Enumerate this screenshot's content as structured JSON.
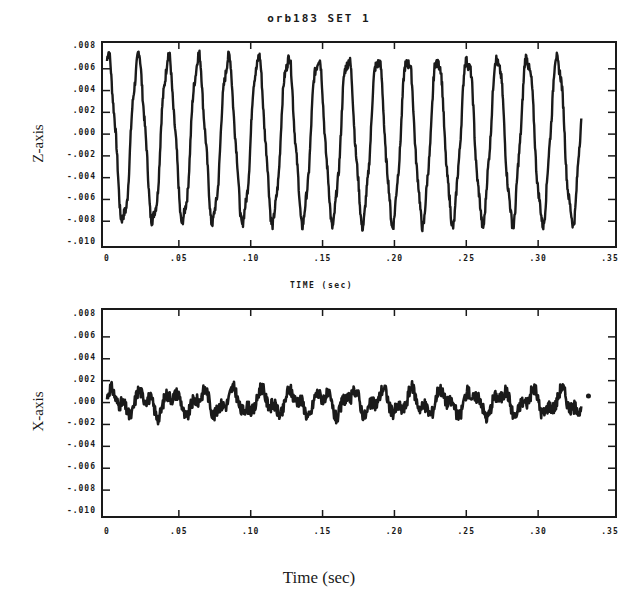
{
  "figure": {
    "title": "orb183 SET 1",
    "mid_xlabel": "TIME (sec)",
    "bottom_xlabel": "Time (sec)"
  },
  "ticks": {
    "y": [
      ".008",
      ".006",
      ".004",
      ".002",
      ".000",
      "-.002",
      "-.004",
      "-.006",
      "-.008",
      "-.010"
    ],
    "x": [
      "0",
      ".05",
      ".10",
      ".15",
      ".20",
      ".25",
      ".30",
      ".35"
    ]
  },
  "chart_data": [
    {
      "type": "line",
      "title": "orb183 SET 1",
      "xlabel": "TIME (sec)",
      "ylabel": "Z-axis",
      "xlim": [
        0,
        0.35
      ],
      "ylim": [
        -0.01,
        0.008
      ],
      "x_ticks": [
        0,
        0.05,
        0.1,
        0.15,
        0.2,
        0.25,
        0.3,
        0.35
      ],
      "y_ticks": [
        0.008,
        0.006,
        0.004,
        0.002,
        0.0,
        -0.002,
        -0.004,
        -0.006,
        -0.008,
        -0.01
      ],
      "grid": false,
      "series": [
        {
          "name": "Z-axis",
          "description": "Near-sinusoidal oscillation, ~16 cycles over 0.33 s (~48 Hz), amplitude ~±0.0075 centered near -0.0005",
          "frequency_hz": 48,
          "amplitude": 0.0075,
          "offset": -0.0005,
          "x_end": 0.33,
          "peaks_approx": 0.0075,
          "troughs_approx": -0.0085
        }
      ]
    },
    {
      "type": "line",
      "xlabel": "Time (sec)",
      "ylabel": "X-axis",
      "xlim": [
        0,
        0.35
      ],
      "ylim": [
        -0.01,
        0.008
      ],
      "x_ticks": [
        0,
        0.05,
        0.1,
        0.15,
        0.2,
        0.25,
        0.3,
        0.35
      ],
      "y_ticks": [
        0.008,
        0.006,
        0.004,
        0.002,
        0.0,
        -0.002,
        -0.004,
        -0.006,
        -0.008,
        -0.01
      ],
      "grid": false,
      "series": [
        {
          "name": "X-axis",
          "description": "Small noisy oscillation around 0, amplitude ~±0.0015, ending ~0.33 s",
          "amplitude": 0.0015,
          "offset": 0.0,
          "x_end": 0.33,
          "range_approx": [
            -0.0025,
            0.0015
          ]
        }
      ]
    }
  ],
  "top_plot": {
    "ylabel": "Z-axis"
  },
  "bottom_plot": {
    "ylabel": "X-axis"
  }
}
